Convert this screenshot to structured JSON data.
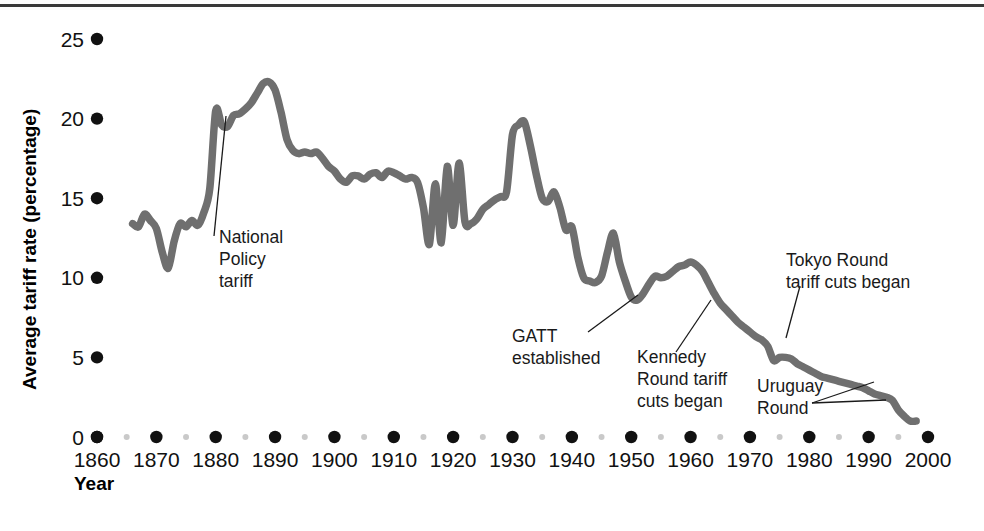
{
  "figure": {
    "width": 984,
    "height": 531,
    "background": "#ffffff",
    "rule_color": "#3a3a3a"
  },
  "chart_data": {
    "type": "line",
    "title": "",
    "subtitle": "",
    "xlabel": "Year",
    "ylabel": "Average tariff rate (percentage)",
    "xlim": [
      1860,
      2000
    ],
    "ylim": [
      0,
      25
    ],
    "grid": false,
    "legend": "none",
    "line_color": "#6f6f6f",
    "line_width": 7.5,
    "x_ticks": [
      1860,
      1870,
      1880,
      1890,
      1900,
      1910,
      1920,
      1930,
      1940,
      1950,
      1960,
      1970,
      1980,
      1990,
      2000
    ],
    "x_tick_labels": [
      "1860",
      "1870",
      "1880",
      "1890",
      "1900",
      "1910",
      "1920",
      "1930",
      "1940",
      "1950",
      "1960",
      "1970",
      "1980",
      "1990",
      "2000"
    ],
    "x_minor_ticks": [
      1865,
      1875,
      1885,
      1895,
      1905,
      1915,
      1925,
      1935,
      1945,
      1955,
      1965,
      1975,
      1985,
      1995
    ],
    "y_ticks": [
      0,
      5,
      10,
      15,
      20,
      25
    ],
    "y_tick_labels": [
      "0",
      "5",
      "10",
      "15",
      "20",
      "25"
    ],
    "tick_marker_style": "dot",
    "series": [
      {
        "name": "Average tariff rate",
        "x": [
          1866,
          1867,
          1868,
          1869,
          1870,
          1871,
          1872,
          1873,
          1874,
          1875,
          1876,
          1877,
          1878,
          1879,
          1880,
          1881,
          1882,
          1883,
          1884,
          1885,
          1886,
          1887,
          1888,
          1889,
          1890,
          1891,
          1892,
          1893,
          1894,
          1895,
          1896,
          1897,
          1898,
          1899,
          1900,
          1901,
          1902,
          1903,
          1904,
          1905,
          1906,
          1907,
          1908,
          1909,
          1910,
          1911,
          1912,
          1913,
          1914,
          1915,
          1916,
          1917,
          1918,
          1919,
          1920,
          1921,
          1922,
          1923,
          1924,
          1925,
          1926,
          1927,
          1928,
          1929,
          1930,
          1931,
          1932,
          1933,
          1934,
          1935,
          1936,
          1937,
          1938,
          1939,
          1940,
          1941,
          1942,
          1943,
          1944,
          1945,
          1946,
          1947,
          1948,
          1949,
          1950,
          1951,
          1952,
          1953,
          1954,
          1955,
          1956,
          1957,
          1958,
          1959,
          1960,
          1961,
          1962,
          1963,
          1964,
          1965,
          1966,
          1967,
          1968,
          1969,
          1970,
          1971,
          1972,
          1973,
          1974,
          1975,
          1976,
          1977,
          1978,
          1979,
          1980,
          1981,
          1982,
          1983,
          1984,
          1985,
          1986,
          1987,
          1988,
          1989,
          1990,
          1991,
          1992,
          1993,
          1994,
          1995,
          1996,
          1997,
          1998
        ],
        "y": [
          13.4,
          13.2,
          14.0,
          13.6,
          13.1,
          11.6,
          10.6,
          12.3,
          13.4,
          13.2,
          13.6,
          13.3,
          14.1,
          15.6,
          20.5,
          19.6,
          19.5,
          20.2,
          20.3,
          20.6,
          21.0,
          21.6,
          22.2,
          22.3,
          21.8,
          20.4,
          18.7,
          18.0,
          17.8,
          17.9,
          17.8,
          17.9,
          17.5,
          17.0,
          16.7,
          16.2,
          16.0,
          16.4,
          16.4,
          16.2,
          16.5,
          16.6,
          16.3,
          16.7,
          16.6,
          16.4,
          16.2,
          16.3,
          16.0,
          14.4,
          12.1,
          15.9,
          12.2,
          17.0,
          13.3,
          17.2,
          13.5,
          13.4,
          13.7,
          14.3,
          14.6,
          14.9,
          15.1,
          15.4,
          19.0,
          19.6,
          19.8,
          18.3,
          16.5,
          15.0,
          14.8,
          15.4,
          14.4,
          13.0,
          13.2,
          11.3,
          10.0,
          9.8,
          9.7,
          10.1,
          11.6,
          12.8,
          11.0,
          9.8,
          8.8,
          8.6,
          9.0,
          9.6,
          10.1,
          10.0,
          10.1,
          10.4,
          10.7,
          10.8,
          11.0,
          10.8,
          10.4,
          9.7,
          9.0,
          8.4,
          8.0,
          7.6,
          7.2,
          6.9,
          6.6,
          6.3,
          6.1,
          5.7,
          4.8,
          5.0,
          5.0,
          4.9,
          4.6,
          4.4,
          4.2,
          4.0,
          3.8,
          3.7,
          3.6,
          3.5,
          3.4,
          3.3,
          3.2,
          3.1,
          2.9,
          2.7,
          2.6,
          2.5,
          2.3,
          1.7,
          1.3,
          1.0,
          1.0
        ]
      }
    ],
    "annotations": [
      {
        "id": "national-policy-tariff",
        "label": "National Policy tariff",
        "lines": [
          "National",
          "Policy",
          "tariff"
        ],
        "year": 1879,
        "value": 20.5
      },
      {
        "id": "gatt-established",
        "label": "GATT established",
        "lines": [
          "GATT",
          "established"
        ],
        "year": 1947,
        "value": 12.8
      },
      {
        "id": "kennedy-round",
        "label": "Kennedy Round tariff cuts began",
        "lines": [
          "Kennedy",
          "Round tariff",
          "cuts began"
        ],
        "year": 1962,
        "value": 10.4
      },
      {
        "id": "tokyo-round",
        "label": "Tokyo Round tariff cuts began",
        "lines": [
          "Tokyo Round",
          "tariff cuts began"
        ],
        "year": 1974,
        "value": 4.8
      },
      {
        "id": "uruguay-round",
        "label": "Uruguay Round",
        "lines": [
          "Uruguay",
          "Round"
        ],
        "year": 1993,
        "value": 2.5
      }
    ]
  }
}
